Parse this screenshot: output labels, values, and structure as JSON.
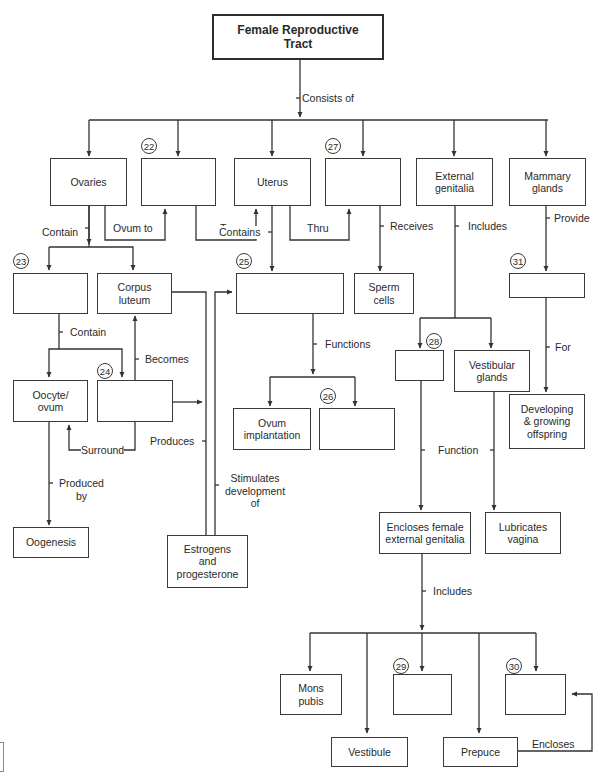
{
  "diagram": {
    "title": "Female Reproductive Tract",
    "type": "concept map"
  },
  "nodes": {
    "title": "Female Reproductive\nTract",
    "ovaries": "Ovaries",
    "blank22": "",
    "uterus": "Uterus",
    "blank27": "",
    "external_genitalia": "External\ngenitalia",
    "mammary_glands": "Mammary\nglands",
    "blank23": "",
    "corpus_luteum": "Corpus\nluteum",
    "blank25": "",
    "sperm_cells": "Sperm\ncells",
    "blank31": "",
    "oocyte_ovum": "Oocyte/\novum",
    "blank24": "",
    "ovum_implantation": "Ovum\nimplantation",
    "blank26": "",
    "blank28": "",
    "vestibular_glands": "Vestibular\nglands",
    "developing_offspring": "Developing\n& growing\noffspring",
    "oogenesis": "Oogenesis",
    "estrogens_progesterone": "Estrogens\nand\nprogesterone",
    "encloses_female_external_genitalia": "Encloses female\nexternal genitalia",
    "lubricates_vagina": "Lubricates\nvagina",
    "mons_pubis": "Mons\npubis",
    "blank29": "",
    "blank30": "",
    "vestibule": "Vestibule",
    "prepuce": "Prepuce"
  },
  "numbers": {
    "n22": "22",
    "n23": "23",
    "n24": "24",
    "n25": "25",
    "n26": "26",
    "n27": "27",
    "n28": "28",
    "n29": "29",
    "n30": "30",
    "n31": "31"
  },
  "links": {
    "consists_of": "Consists of",
    "contain_ovaries": "Contain",
    "ovum_to": "Ovum to",
    "to": "To",
    "thru": "Thru",
    "contains_uterus": "Contains",
    "receives": "Receives",
    "includes_external": "Includes",
    "provide": "Provide",
    "contain_23": "Contain",
    "becomes": "Becomes",
    "surround": "Surround",
    "produces": "Produces",
    "functions": "Functions",
    "for": "For",
    "produced_by": "Produced\nby",
    "stimulates": "Stimulates\ndevelopment\nof",
    "function": "Function",
    "includes_bottom": "Includes",
    "encloses": "Encloses"
  }
}
